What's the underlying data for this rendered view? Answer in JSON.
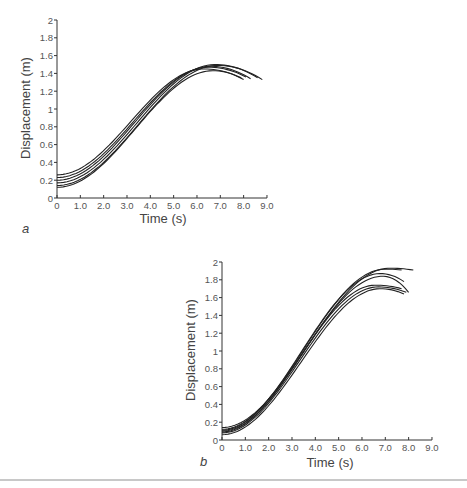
{
  "chart_data": [
    {
      "type": "line",
      "panel_label": "a",
      "title": "",
      "xlabel": "Time (s)",
      "ylabel": "Displacement (m)",
      "xlim": [
        0,
        9
      ],
      "ylim": [
        0,
        2
      ],
      "xticks": [
        "0",
        "1.0",
        "2.0",
        "3.0",
        "4.0",
        "5.0",
        "6.0",
        "7.0",
        "8.0",
        "9.0"
      ],
      "yticks": [
        "0",
        "0.2",
        "0.4",
        "0.6",
        "0.8",
        "1",
        "1.2",
        "1.4",
        "1.6",
        "1.8",
        "2"
      ],
      "grid": false,
      "legend": null,
      "series": [
        {
          "name": "trial 1",
          "start": 0.26,
          "peak": 1.45,
          "t_peak": 6.3,
          "t_end": 7.9,
          "end": 1.35,
          "shift": -0.3
        },
        {
          "name": "trial 2",
          "start": 0.23,
          "peak": 1.47,
          "t_peak": 6.5,
          "t_end": 8.1,
          "end": 1.36,
          "shift": -0.15
        },
        {
          "name": "trial 3",
          "start": 0.2,
          "peak": 1.48,
          "t_peak": 6.6,
          "t_end": 8.3,
          "end": 1.34,
          "shift": 0.0
        },
        {
          "name": "trial 4",
          "start": 0.17,
          "peak": 1.5,
          "t_peak": 6.8,
          "t_end": 8.6,
          "end": 1.35,
          "shift": 0.1
        },
        {
          "name": "trial 5",
          "start": 0.14,
          "peak": 1.49,
          "t_peak": 6.9,
          "t_end": 8.8,
          "end": 1.33,
          "shift": 0.2
        },
        {
          "name": "trial 6",
          "start": 0.12,
          "peak": 1.43,
          "t_peak": 6.7,
          "t_end": 8.0,
          "end": 1.33,
          "shift": 0.3
        }
      ]
    },
    {
      "type": "line",
      "panel_label": "b",
      "title": "",
      "xlabel": "Time (s)",
      "ylabel": "Displacement (m)",
      "xlim": [
        0,
        9
      ],
      "ylim": [
        0,
        2
      ],
      "xticks": [
        "0",
        "1.0",
        "2.0",
        "3.0",
        "4.0",
        "5.0",
        "6.0",
        "7.0",
        "8.0",
        "9.0"
      ],
      "yticks": [
        "0",
        "0.2",
        "0.4",
        "0.6",
        "0.8",
        "1",
        "1.2",
        "1.4",
        "1.6",
        "1.8",
        "2"
      ],
      "grid": false,
      "legend": null,
      "series": [
        {
          "name": "trial 1",
          "start": 0.14,
          "peak": 1.93,
          "t_peak": 7.2,
          "t_end": 8.2,
          "end": 1.91,
          "shift": -0.25
        },
        {
          "name": "trial 2",
          "start": 0.12,
          "peak": 1.92,
          "t_peak": 7.0,
          "t_end": 7.7,
          "end": 1.91,
          "shift": -0.1
        },
        {
          "name": "trial 3",
          "start": 0.11,
          "peak": 1.87,
          "t_peak": 6.8,
          "t_end": 7.8,
          "end": 1.78,
          "shift": 0.0
        },
        {
          "name": "trial 4",
          "start": 0.1,
          "peak": 1.84,
          "t_peak": 6.9,
          "t_end": 8.0,
          "end": 1.66,
          "shift": 0.1
        },
        {
          "name": "trial 5",
          "start": 0.09,
          "peak": 1.74,
          "t_peak": 6.6,
          "t_end": 7.7,
          "end": 1.7,
          "shift": 0.15
        },
        {
          "name": "trial 6",
          "start": 0.08,
          "peak": 1.72,
          "t_peak": 6.7,
          "t_end": 7.9,
          "end": 1.66,
          "shift": 0.2
        },
        {
          "name": "trial 7",
          "start": 0.06,
          "peak": 1.7,
          "t_peak": 6.8,
          "t_end": 7.8,
          "end": 1.64,
          "shift": 0.3
        }
      ]
    }
  ],
  "layout": {
    "charts": [
      {
        "x0": 57,
        "y0": 198,
        "px_per_s": 23.33,
        "px_per_m": 89,
        "xlabel_pos": [
          163,
          223
        ],
        "ylabel_pos": [
          30,
          108
        ],
        "panel_pos": [
          22,
          233
        ]
      },
      {
        "x0": 222,
        "y0": 440,
        "px_per_s": 23.33,
        "px_per_m": 89,
        "xlabel_pos": [
          330,
          467
        ],
        "ylabel_pos": [
          195,
          350
        ],
        "panel_pos": [
          200,
          466
        ]
      }
    ],
    "line_color": "#222222"
  }
}
